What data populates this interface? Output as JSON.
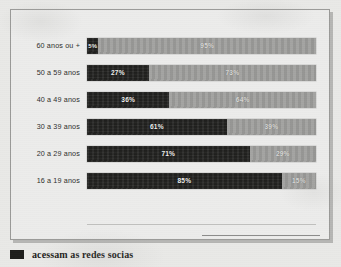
{
  "legend": {
    "swatch_color": "#1d1d1b",
    "label": "acessam as redes socias"
  },
  "colors": {
    "dark": "#232321",
    "light": "#9d9d9b",
    "panel_background": "#ececeb",
    "page_background": "#e9e9e7",
    "frame_border": "#9a9a98",
    "label_text": "#2e2e2c"
  },
  "chart_data": {
    "type": "bar",
    "title": "",
    "subtitle": "",
    "xlabel": "",
    "ylabel": "",
    "orientation": "horizontal",
    "stacked": true,
    "normalized_percent": true,
    "grid": false,
    "legend_position": "below",
    "xlim": [
      0,
      100
    ],
    "categories": [
      "60 anos ou +",
      "50 a 59 anos",
      "40 a 49 anos",
      "30 a 39 anos",
      "20 a 29 anos",
      "16 a 19 anos"
    ],
    "series": [
      {
        "name": "acessam as redes socias",
        "color": "#232321",
        "values": [
          5,
          27,
          36,
          61,
          71,
          85
        ],
        "labels": [
          "5%",
          "27%",
          "36%",
          "61%",
          "71%",
          "85%"
        ]
      },
      {
        "name": "",
        "color": "#9d9d9b",
        "values": [
          95,
          73,
          64,
          39,
          29,
          15
        ],
        "labels": [
          "95%",
          "73%",
          "64%",
          "39%",
          "29%",
          "15%"
        ]
      }
    ],
    "rows": [
      {
        "category": "60 anos ou +",
        "dark_value": 5,
        "dark_label": "5%",
        "light_value": 95,
        "light_label": "95%"
      },
      {
        "category": "50 a 59 anos",
        "dark_value": 27,
        "dark_label": "27%",
        "light_value": 73,
        "light_label": "73%"
      },
      {
        "category": "40 a 49 anos",
        "dark_value": 36,
        "dark_label": "36%",
        "light_value": 64,
        "light_label": "64%"
      },
      {
        "category": "30 a 39 anos",
        "dark_value": 61,
        "dark_label": "61%",
        "light_value": 39,
        "light_label": "39%"
      },
      {
        "category": "20 a 29 anos",
        "dark_value": 71,
        "dark_label": "71%",
        "light_value": 29,
        "light_label": "29%"
      },
      {
        "category": "16 a 19 anos",
        "dark_value": 85,
        "dark_label": "85%",
        "light_value": 15,
        "light_label": "15%"
      }
    ]
  }
}
